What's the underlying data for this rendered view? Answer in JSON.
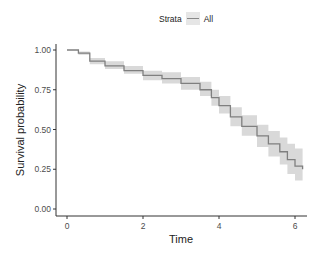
{
  "chart_data": {
    "type": "line",
    "subtype": "kaplan-meier step curve with confidence band",
    "title": "",
    "xlabel": "Time",
    "ylabel": "Survival probability",
    "xlim": [
      0,
      6.2
    ],
    "ylim": [
      0,
      1
    ],
    "xticks": [
      "0",
      "2",
      "4",
      "6"
    ],
    "yticks": [
      "0.00",
      "0.25",
      "0.50",
      "0.75",
      "1.00"
    ],
    "grid": false,
    "legend": {
      "position": "top",
      "title": "Strata",
      "entries": [
        "All"
      ]
    },
    "series": [
      {
        "name": "All",
        "color": "#7f7f7f",
        "band_color": "#d9d9d9",
        "x": [
          0,
          0.3,
          0.6,
          1.0,
          1.5,
          2.0,
          2.5,
          3.0,
          3.5,
          3.8,
          4.0,
          4.3,
          4.6,
          5.0,
          5.3,
          5.6,
          5.8,
          6.0,
          6.2
        ],
        "values": [
          1.0,
          0.98,
          0.93,
          0.9,
          0.87,
          0.84,
          0.82,
          0.79,
          0.75,
          0.7,
          0.65,
          0.58,
          0.52,
          0.46,
          0.41,
          0.36,
          0.31,
          0.27,
          0.25
        ],
        "lower": [
          1.0,
          0.97,
          0.91,
          0.88,
          0.85,
          0.81,
          0.79,
          0.75,
          0.71,
          0.65,
          0.6,
          0.52,
          0.46,
          0.39,
          0.33,
          0.28,
          0.22,
          0.18,
          0.16
        ],
        "upper": [
          1.0,
          0.99,
          0.95,
          0.93,
          0.9,
          0.87,
          0.86,
          0.83,
          0.8,
          0.75,
          0.71,
          0.64,
          0.59,
          0.53,
          0.49,
          0.45,
          0.41,
          0.38,
          0.37
        ]
      }
    ]
  },
  "legend": {
    "title": "Strata",
    "label": "All"
  }
}
